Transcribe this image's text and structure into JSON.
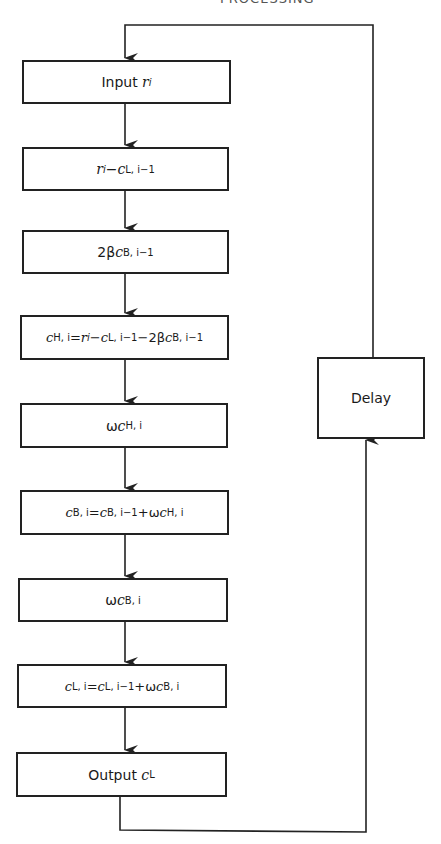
{
  "header_fragment": "PROCESSING",
  "flowchart": {
    "boxes": [
      {
        "id": "input",
        "label": "Input",
        "var": "r",
        "sub": "i"
      },
      {
        "id": "step2",
        "text": "r_i − c_L,i−1"
      },
      {
        "id": "step3",
        "text": "2βc_B,i−1"
      },
      {
        "id": "step4",
        "text": "c_H,i = r_i − c_L,i−1 − 2βc_B,i−1"
      },
      {
        "id": "step5",
        "text": "ωc_H,i"
      },
      {
        "id": "step6",
        "text": "c_B,i = c_B,i−1 + ωc_H,i"
      },
      {
        "id": "step7",
        "text": "ωc_B,i"
      },
      {
        "id": "step8",
        "text": "c_L,i = c_L,i−1 + ωc_B,i"
      },
      {
        "id": "output",
        "label": "Output",
        "var": "c",
        "sub": "L"
      }
    ],
    "delay": {
      "label": "Delay"
    }
  },
  "parts": {
    "input_label": "Input",
    "output_label": "Output",
    "delay_label": "Delay",
    "r": "r",
    "c": "c",
    "i": "i",
    "L": "L",
    "B": "B",
    "H": "H",
    "two_beta": "2β",
    "omega": "ω",
    "minus": " − ",
    "plus": " + ",
    "eq": " = ",
    "sub_L_im1": "L, i−1",
    "sub_B_im1": "B, i−1",
    "sub_H_i": "H, i",
    "sub_B_i": "B, i",
    "sub_L_i": "L, i"
  }
}
